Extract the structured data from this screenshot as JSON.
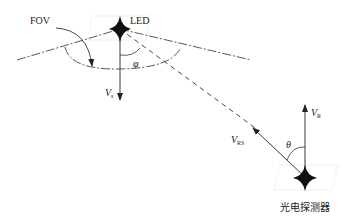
{
  "diagram": {
    "labels": {
      "fov": "FOV",
      "led": "LED",
      "vs_main": "V",
      "vs_sub": "s",
      "phi": "φ",
      "vrs_main": "V",
      "vrs_sub": "RS",
      "vr_main": "V",
      "vr_sub": "R",
      "theta": "θ",
      "detector": "光电探测器"
    },
    "nodes": [
      {
        "id": "led",
        "label": "LED",
        "shape": "four-point-star",
        "x": 120,
        "y": 29
      },
      {
        "id": "detector",
        "label": "光电探测器",
        "shape": "four-point-star",
        "x": 305,
        "y": 178
      }
    ],
    "edges": [
      {
        "from": "led",
        "to": "detector",
        "style": "dashed",
        "meaning": "line of sight"
      },
      {
        "from": "led",
        "direction": "down",
        "label": "Vs",
        "style": "solid-arrow"
      },
      {
        "from": "detector",
        "direction": "toward-led",
        "label": "VRS",
        "style": "solid-arrow"
      },
      {
        "from": "detector",
        "direction": "up",
        "label": "VR",
        "style": "solid-arrow"
      }
    ],
    "angles": [
      {
        "label": "φ",
        "between": [
          "Vs",
          "line of sight"
        ]
      },
      {
        "label": "θ",
        "between": [
          "VR",
          "VRS"
        ]
      }
    ],
    "colors": {
      "stroke": "#333333",
      "fill": "#111111"
    }
  }
}
